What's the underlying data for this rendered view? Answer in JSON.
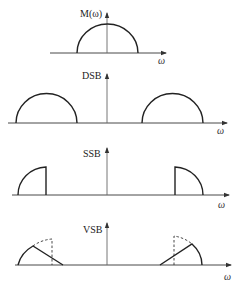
{
  "diagram": {
    "panels": [
      {
        "id": "baseband",
        "label": "M(ω)",
        "x_label": "ω",
        "shape": "semicircle centered at origin"
      },
      {
        "id": "dsb",
        "label": "DSB",
        "x_label": "ω",
        "shape": "two full semicircle sidebands at ±ωc"
      },
      {
        "id": "ssb",
        "label": "SSB",
        "x_label": "ω",
        "shape": "single (outer) sideband quarter-arcs with vertical cutoff"
      },
      {
        "id": "vsb",
        "label": "VSB",
        "x_label": "ω",
        "shape": "outer sideband with linear vestigial roll-off; dashed original spectrum"
      }
    ],
    "colors": {
      "background": "#ffffff",
      "stroke": "#222222",
      "axis": "#333333"
    }
  }
}
